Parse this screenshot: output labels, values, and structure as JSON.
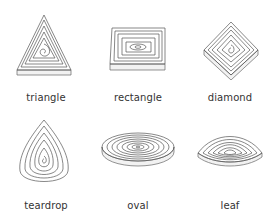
{
  "shapes": [
    {
      "id": "triangle",
      "label": "triangle"
    },
    {
      "id": "rectangle",
      "label": "rectangle"
    },
    {
      "id": "diamond",
      "label": "diamond"
    },
    {
      "id": "teardrop",
      "label": "teardrop"
    },
    {
      "id": "oval",
      "label": "oval"
    },
    {
      "id": "leaf",
      "label": "leaf"
    }
  ]
}
